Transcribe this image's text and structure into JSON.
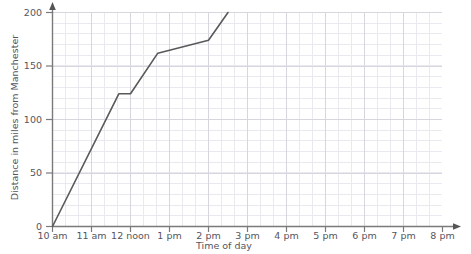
{
  "chart_data": {
    "type": "line",
    "title": "",
    "xlabel": "Time of day",
    "ylabel": "Distance in miles from Manchester",
    "x_tick_labels": [
      "10 am",
      "11 am",
      "12 noon",
      "1 pm",
      "2 pm",
      "3 pm",
      "4 pm",
      "5 pm",
      "6 pm",
      "7 pm",
      "8 pm"
    ],
    "x_tick_hours": [
      10,
      11,
      12,
      13,
      14,
      15,
      16,
      17,
      18,
      19,
      20
    ],
    "y_tick_labels": [
      "0",
      "50",
      "100",
      "150",
      "200"
    ],
    "y_tick_values": [
      0,
      50,
      100,
      150,
      200
    ],
    "xlim": [
      10,
      20
    ],
    "ylim": [
      0,
      200
    ],
    "grid": true,
    "grid_minor": true,
    "legend": "none",
    "series": [
      {
        "name": "Journey from Manchester",
        "color": "#595959",
        "points": [
          {
            "x": 10.0,
            "label": "10 am",
            "y": 0
          },
          {
            "x": 11.7,
            "label": "11:42 am",
            "y": 124
          },
          {
            "x": 12.0,
            "label": "12 noon",
            "y": 124
          },
          {
            "x": 12.7,
            "label": "12:42 pm",
            "y": 162
          },
          {
            "x": 14.0,
            "label": "2 pm",
            "y": 174
          },
          {
            "x": 14.5,
            "label": "2:30 pm",
            "y": 200
          }
        ]
      }
    ]
  },
  "axis": {
    "y_arrow": "up-arrow",
    "x_arrow": "right-arrow"
  }
}
